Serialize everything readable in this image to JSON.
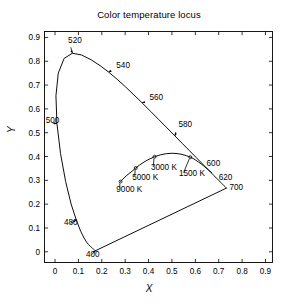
{
  "chart_data": {
    "type": "line",
    "title": "Color temperature locus",
    "xlabel": "X",
    "ylabel": "Y",
    "xlim": [
      -0.045,
      0.93
    ],
    "ylim": [
      -0.045,
      0.925
    ],
    "xticks": [
      0,
      0.1,
      0.2,
      0.3,
      0.4,
      0.5,
      0.6,
      0.7,
      0.8,
      0.9
    ],
    "yticks": [
      0,
      0.1,
      0.2,
      0.3,
      0.4,
      0.5,
      0.6,
      0.7,
      0.8,
      0.9
    ],
    "xticklabels": [
      "0",
      "0.1",
      "0.2",
      "0.3",
      "0.4",
      "0.5",
      "0.6",
      "0.7",
      "0.8",
      "0.9"
    ],
    "yticklabels": [
      "0",
      "0.1",
      "0.2",
      "0.3",
      "0.4",
      "0.5",
      "0.6",
      "0.7",
      "0.8",
      "0.9"
    ],
    "grid": false,
    "legend": false,
    "series": [
      {
        "name": "spectral-locus",
        "points": [
          [
            0.1741,
            0.005
          ],
          [
            0.174,
            0.005
          ],
          [
            0.1738,
            0.0049
          ],
          [
            0.1736,
            0.0049
          ],
          [
            0.1733,
            0.0048
          ],
          [
            0.173,
            0.0048
          ],
          [
            0.1726,
            0.0048
          ],
          [
            0.1721,
            0.0048
          ],
          [
            0.1714,
            0.0051
          ],
          [
            0.1703,
            0.0058
          ],
          [
            0.1689,
            0.0069
          ],
          [
            0.1669,
            0.0086
          ],
          [
            0.1644,
            0.0109
          ],
          [
            0.1611,
            0.0138
          ],
          [
            0.1566,
            0.0177
          ],
          [
            0.151,
            0.0227
          ],
          [
            0.144,
            0.0297
          ],
          [
            0.1355,
            0.0399
          ],
          [
            0.1241,
            0.0578
          ],
          [
            0.1096,
            0.0868
          ],
          [
            0.0913,
            0.1327
          ],
          [
            0.0687,
            0.2007
          ],
          [
            0.0454,
            0.295
          ],
          [
            0.0235,
            0.4127
          ],
          [
            0.0082,
            0.5384
          ],
          [
            0.0039,
            0.6548
          ],
          [
            0.0139,
            0.7502
          ],
          [
            0.0389,
            0.812
          ],
          [
            0.0743,
            0.8338
          ],
          [
            0.1142,
            0.8262
          ],
          [
            0.1547,
            0.8059
          ],
          [
            0.1929,
            0.7816
          ],
          [
            0.2296,
            0.7543
          ],
          [
            0.2658,
            0.7243
          ],
          [
            0.3016,
            0.6923
          ],
          [
            0.3373,
            0.6589
          ],
          [
            0.3731,
            0.6245
          ],
          [
            0.4087,
            0.5896
          ],
          [
            0.4441,
            0.5547
          ],
          [
            0.4788,
            0.5202
          ],
          [
            0.5125,
            0.4866
          ],
          [
            0.5448,
            0.4544
          ],
          [
            0.5752,
            0.4242
          ],
          [
            0.6029,
            0.3965
          ],
          [
            0.627,
            0.3725
          ],
          [
            0.6482,
            0.3514
          ],
          [
            0.6658,
            0.334
          ],
          [
            0.6801,
            0.3197
          ],
          [
            0.6915,
            0.3083
          ],
          [
            0.7006,
            0.2993
          ],
          [
            0.7079,
            0.292
          ],
          [
            0.714,
            0.2859
          ],
          [
            0.719,
            0.2809
          ],
          [
            0.723,
            0.277
          ],
          [
            0.726,
            0.274
          ],
          [
            0.7283,
            0.2717
          ],
          [
            0.73,
            0.27
          ],
          [
            0.7311,
            0.2689
          ],
          [
            0.732,
            0.268
          ],
          [
            0.7327,
            0.2673
          ]
        ]
      },
      {
        "name": "purple-line",
        "points": [
          [
            0.7327,
            0.2673
          ],
          [
            0.1741,
            0.005
          ]
        ]
      },
      {
        "name": "planckian-locus",
        "points": [
          [
            0.2804,
            0.295
          ],
          [
            0.287,
            0.302
          ],
          [
            0.2952,
            0.31
          ],
          [
            0.305,
            0.319
          ],
          [
            0.3161,
            0.328
          ],
          [
            0.3289,
            0.3378
          ],
          [
            0.345,
            0.3516
          ],
          [
            0.361,
            0.364
          ],
          [
            0.3805,
            0.3768
          ],
          [
            0.402,
            0.3887
          ],
          [
            0.4255,
            0.399
          ],
          [
            0.45,
            0.4069
          ],
          [
            0.476,
            0.412
          ],
          [
            0.5,
            0.4137
          ],
          [
            0.522,
            0.4125
          ],
          [
            0.543,
            0.409
          ],
          [
            0.562,
            0.4035
          ],
          [
            0.5785,
            0.3972
          ],
          [
            0.59,
            0.392
          ],
          [
            0.6,
            0.386
          ],
          [
            0.612,
            0.378
          ],
          [
            0.625,
            0.369
          ],
          [
            0.64,
            0.357
          ],
          [
            0.656,
            0.344
          ],
          [
            0.67,
            0.332
          ]
        ]
      }
    ],
    "wavelength_markers": [
      {
        "label": "400",
        "x": 0.1741,
        "y": 0.005,
        "lx": 0.132,
        "ly": -0.024,
        "anchor": "start"
      },
      {
        "label": "480",
        "x": 0.0913,
        "y": 0.1327,
        "lx": 0.038,
        "ly": 0.112,
        "anchor": "start"
      },
      {
        "label": "500",
        "x": 0.0082,
        "y": 0.5384,
        "lx": -0.04,
        "ly": 0.542,
        "anchor": "start"
      },
      {
        "label": "520",
        "x": 0.0743,
        "y": 0.8338,
        "lx": 0.056,
        "ly": 0.878,
        "anchor": "start"
      },
      {
        "label": "540",
        "x": 0.2296,
        "y": 0.7543,
        "lx": 0.262,
        "ly": 0.772,
        "anchor": "start"
      },
      {
        "label": "560",
        "x": 0.3731,
        "y": 0.6245,
        "lx": 0.404,
        "ly": 0.638,
        "anchor": "start"
      },
      {
        "label": "580",
        "x": 0.5125,
        "y": 0.4866,
        "lx": 0.528,
        "ly": 0.522,
        "anchor": "start"
      },
      {
        "label": "600",
        "x": 0.627,
        "y": 0.3725,
        "lx": 0.648,
        "ly": 0.362,
        "anchor": "start"
      },
      {
        "label": "620",
        "x": 0.6915,
        "y": 0.3083,
        "lx": 0.7,
        "ly": 0.3,
        "anchor": "start"
      },
      {
        "label": "700",
        "x": 0.7327,
        "y": 0.2673,
        "lx": 0.746,
        "ly": 0.258,
        "anchor": "start"
      }
    ],
    "temperature_markers": [
      {
        "label": "9000 K",
        "x": 0.2804,
        "y": 0.295,
        "lx": 0.262,
        "ly": 0.252,
        "anchor": "start"
      },
      {
        "label": "5000 K",
        "x": 0.345,
        "y": 0.3516,
        "lx": 0.33,
        "ly": 0.302,
        "anchor": "start"
      },
      {
        "label": "3000 K",
        "x": 0.4255,
        "y": 0.399,
        "lx": 0.41,
        "ly": 0.345,
        "anchor": "start"
      },
      {
        "label": "1500 K",
        "x": 0.5785,
        "y": 0.3972,
        "lx": 0.53,
        "ly": 0.318,
        "anchor": "start"
      }
    ]
  },
  "figure": {
    "line_color": "#000000",
    "axis_color": "#000000",
    "background": "#ffffff"
  }
}
